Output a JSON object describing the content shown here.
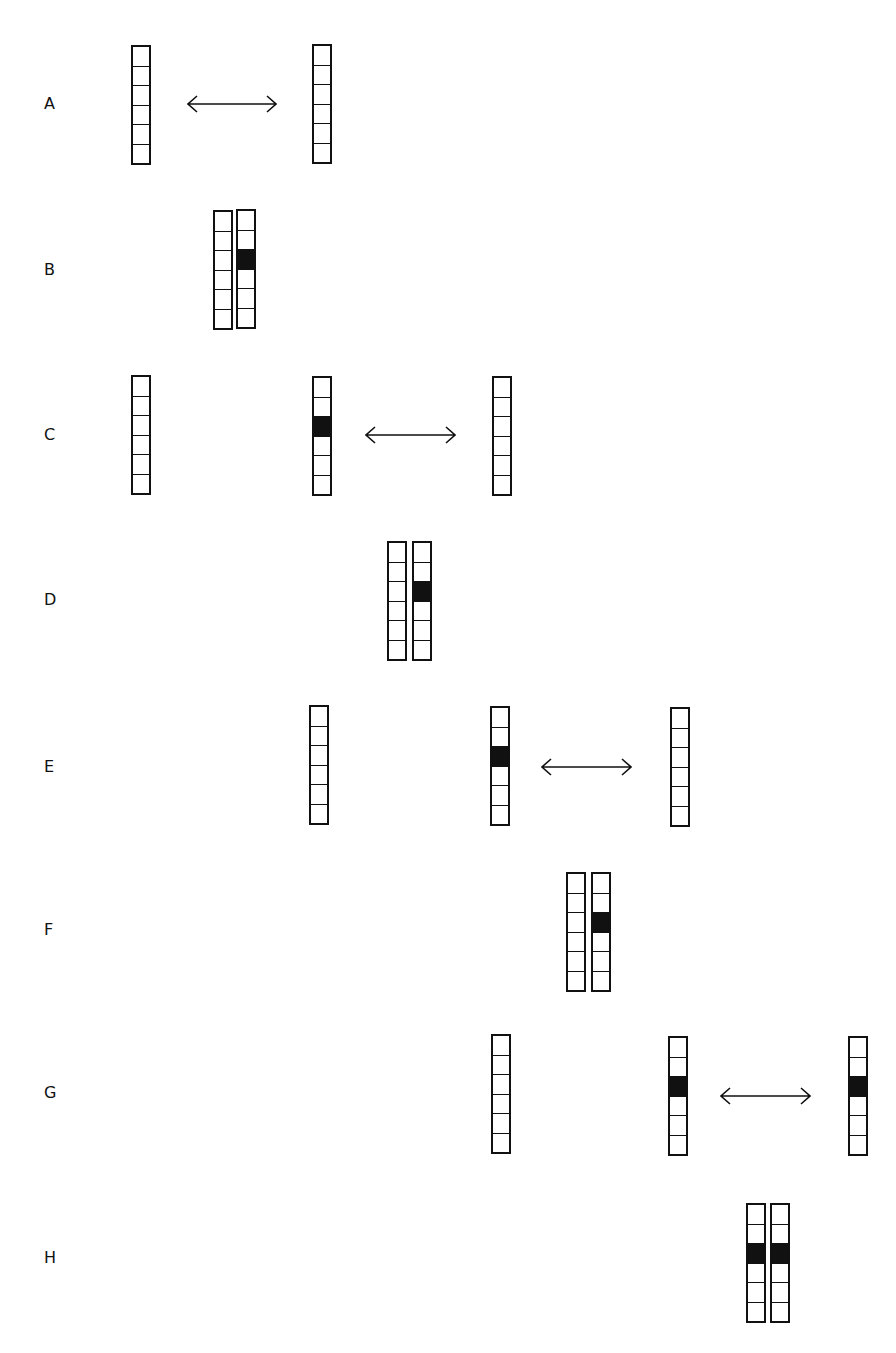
{
  "rows": [
    {
      "label": "A",
      "label_y": 94,
      "columns": [
        {
          "x": 131,
          "y": 45,
          "filled": []
        },
        {
          "x": 312,
          "y": 44,
          "filled": []
        }
      ],
      "arrows": [
        {
          "x1": 187,
          "x2": 277,
          "y": 104
        }
      ]
    },
    {
      "label": "B",
      "label_y": 260,
      "columns": [
        {
          "x": 213,
          "y": 210,
          "filled": []
        },
        {
          "x": 236,
          "y": 209,
          "filled": [
            2
          ]
        }
      ],
      "arrows": []
    },
    {
      "label": "C",
      "label_y": 425,
      "columns": [
        {
          "x": 131,
          "y": 375,
          "filled": []
        },
        {
          "x": 312,
          "y": 376,
          "filled": [
            2
          ]
        },
        {
          "x": 492,
          "y": 376,
          "filled": []
        }
      ],
      "arrows": [
        {
          "x1": 365,
          "x2": 456,
          "y": 435
        }
      ]
    },
    {
      "label": "D",
      "label_y": 590,
      "columns": [
        {
          "x": 387,
          "y": 541,
          "filled": []
        },
        {
          "x": 412,
          "y": 541,
          "filled": [
            2
          ]
        }
      ],
      "arrows": []
    },
    {
      "label": "E",
      "label_y": 757,
      "columns": [
        {
          "x": 309,
          "y": 705,
          "filled": []
        },
        {
          "x": 490,
          "y": 706,
          "filled": [
            2
          ]
        },
        {
          "x": 670,
          "y": 707,
          "filled": []
        }
      ],
      "arrows": [
        {
          "x1": 541,
          "x2": 632,
          "y": 767
        }
      ]
    },
    {
      "label": "F",
      "label_y": 920,
      "columns": [
        {
          "x": 566,
          "y": 872,
          "filled": []
        },
        {
          "x": 591,
          "y": 872,
          "filled": [
            2
          ]
        }
      ],
      "arrows": []
    },
    {
      "label": "G",
      "label_y": 1083,
      "columns": [
        {
          "x": 491,
          "y": 1034,
          "filled": []
        },
        {
          "x": 668,
          "y": 1036,
          "filled": [
            2
          ]
        },
        {
          "x": 848,
          "y": 1036,
          "filled": [
            2
          ]
        }
      ],
      "arrows": [
        {
          "x1": 720,
          "x2": 811,
          "y": 1096
        }
      ]
    },
    {
      "label": "H",
      "label_y": 1248,
      "columns": [
        {
          "x": 746,
          "y": 1203,
          "filled": [
            2
          ]
        },
        {
          "x": 770,
          "y": 1203,
          "filled": [
            2
          ]
        }
      ],
      "arrows": []
    }
  ],
  "cells_per_column": 6,
  "label_x": 44,
  "ink_color": "#111111"
}
